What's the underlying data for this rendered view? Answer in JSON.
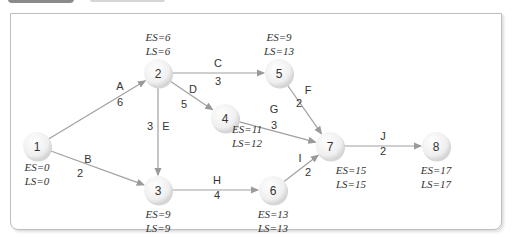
{
  "diagram": {
    "type": "network-diagram",
    "nodes": [
      {
        "id": "1",
        "x": 37,
        "y": 146,
        "es": "ES=0",
        "ls": "LS=0",
        "lx": 37,
        "ly": 171
      },
      {
        "id": "2",
        "x": 158,
        "y": 73,
        "es": "ES=6",
        "ls": "LS=6",
        "lx": 158,
        "ly": 41
      },
      {
        "id": "3",
        "x": 158,
        "y": 190,
        "es": "ES=9",
        "ls": "LS=9",
        "lx": 158,
        "ly": 218
      },
      {
        "id": "4",
        "x": 225,
        "y": 118,
        "es": "ES=11",
        "ls": "LS=12",
        "lx": 247,
        "ly": 133
      },
      {
        "id": "5",
        "x": 279,
        "y": 73,
        "es": "ES=9",
        "ls": "LS=13",
        "lx": 279,
        "ly": 41
      },
      {
        "id": "6",
        "x": 273,
        "y": 190,
        "es": "ES=13",
        "ls": "LS=13",
        "lx": 273,
        "ly": 218
      },
      {
        "id": "7",
        "x": 330,
        "y": 146,
        "es": "ES=15",
        "ls": "LS=15",
        "lx": 351,
        "ly": 174
      },
      {
        "id": "8",
        "x": 436,
        "y": 146,
        "es": "ES=17",
        "ls": "LS=17",
        "lx": 436,
        "ly": 174
      }
    ],
    "edges": [
      {
        "from": "1",
        "to": "2",
        "activity": "A",
        "duration": "6",
        "ax": 120,
        "ay": 90,
        "dx": 120,
        "dy": 106
      },
      {
        "from": "1",
        "to": "3",
        "activity": "B",
        "duration": "2",
        "ax": 88,
        "ay": 163,
        "dx": 80,
        "dy": 177
      },
      {
        "from": "2",
        "to": "5",
        "activity": "C",
        "duration": "3",
        "ax": 218,
        "ay": 67,
        "dx": 218,
        "dy": 85
      },
      {
        "from": "2",
        "to": "4",
        "activity": "D",
        "duration": "5",
        "ax": 193,
        "ay": 93,
        "dx": 184,
        "dy": 108
      },
      {
        "from": "2",
        "to": "3",
        "activity": "E",
        "duration": "3",
        "ax": 166,
        "ay": 130,
        "dx": 150,
        "dy": 130
      },
      {
        "from": "5",
        "to": "7",
        "activity": "F",
        "duration": "2",
        "ax": 308,
        "ay": 94,
        "dx": 299,
        "dy": 107
      },
      {
        "from": "4",
        "to": "7",
        "activity": "G",
        "duration": "3",
        "ax": 274,
        "ay": 113,
        "dx": 274,
        "dy": 129
      },
      {
        "from": "3",
        "to": "6",
        "activity": "H",
        "duration": "4",
        "ax": 217,
        "ay": 184,
        "dx": 217,
        "dy": 199
      },
      {
        "from": "6",
        "to": "7",
        "activity": "I",
        "duration": "2",
        "ax": 300,
        "ay": 162,
        "dx": 308,
        "dy": 176
      },
      {
        "from": "7",
        "to": "8",
        "activity": "J",
        "duration": "2",
        "ax": 383,
        "ay": 140,
        "dx": 383,
        "dy": 155
      }
    ]
  }
}
